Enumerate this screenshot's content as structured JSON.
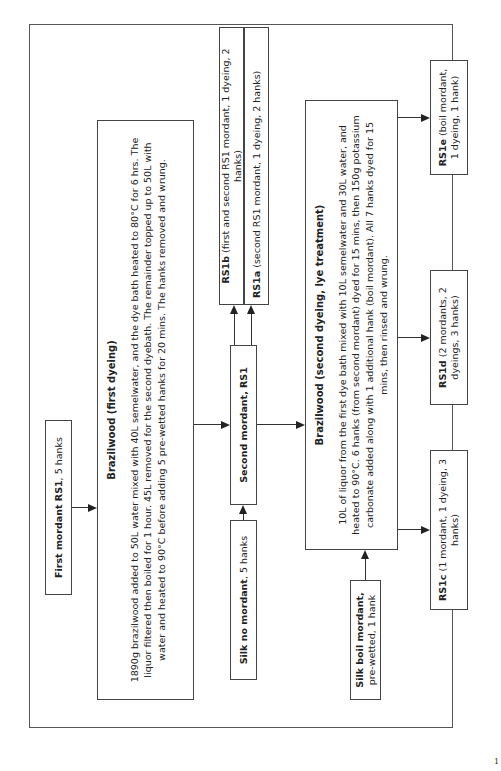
{
  "diagram": {
    "orientation": "rotated 90 degrees counter-clockwise",
    "nodes": {
      "first_mordant": {
        "bold": "First mordant RS1",
        "text": ", 5 hanks"
      },
      "brazilwood_first": {
        "title": "Brazilwood (first dyeing)",
        "body": "1890g brazilwood added to 50L water mixed with 40L semelwater, and the dye bath heated to 80°C for 6 hrs. The liquor filtered then boiled for 1 hour. 45L removed for the second dyebath. The remainder topped up to 50L with water and heated to 90°C before adding 5 pre-wetted hanks for 20 mins. The hanks removed and wrung."
      },
      "rs1b": {
        "bold": "RS1b",
        "text": " (first and second RS1 mordant, 1 dyeing, 2 hanks)"
      },
      "rs1a": {
        "bold": "RS1a",
        "text": " (second RS1 mordant, 1 dyeing, 2 hanks)"
      },
      "second_mordant": {
        "bold": "Second mordant, RS1"
      },
      "silk_no_mordant": {
        "bold": "Silk no mordant",
        "text": ", 5 hanks"
      },
      "brazilwood_second": {
        "title": "Brazilwood (second dyeing, lye treatment)",
        "body": "10L of liquor from the first dye bath mixed with 10L semelwater and 30L water, and heated to 90°C. 6 hanks (from second mordant) dyed for 15 mins, then 150g potassium carbonate added along with 1 additional hank (boil mordant). All 7 hanks dyed for 15 mins, then rinsed and wrung."
      },
      "silk_boil_mordant": {
        "bold": "Silk boil mordant,",
        "text": "pre-wetted, 1 hank"
      },
      "rs1c": {
        "bold": "RS1c",
        "text": " (1 mordant, 1 dyeing, 3 hanks)"
      },
      "rs1d": {
        "bold": "RS1d",
        "text": " (2 mordants, 2 dyeings, 3 hanks)"
      },
      "rs1e": {
        "bold": "RS1e",
        "text": " (boil mordant, 1 dyeing, 1 hank)"
      }
    },
    "edges": [
      {
        "from": "first_mordant",
        "to": "brazilwood_first"
      },
      {
        "from": "brazilwood_first",
        "to": "second_mordant"
      },
      {
        "from": "silk_no_mordant",
        "to": "second_mordant"
      },
      {
        "from": "second_mordant",
        "to": "rs1b"
      },
      {
        "from": "second_mordant",
        "to": "rs1a"
      },
      {
        "from": "second_mordant",
        "to": "brazilwood_second"
      },
      {
        "from": "silk_boil_mordant",
        "to": "brazilwood_second"
      },
      {
        "from": "brazilwood_second",
        "to": "rs1c"
      },
      {
        "from": "brazilwood_second",
        "to": "rs1d"
      },
      {
        "from": "brazilwood_second",
        "to": "rs1e"
      }
    ],
    "page_number": "1"
  }
}
